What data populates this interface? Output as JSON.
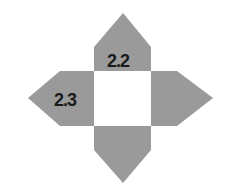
{
  "diagram": {
    "type": "cube-net-star",
    "colors": {
      "arm_fill": "#9a9a9a",
      "center_fill": "#ffffff",
      "label": "#1a1a1a"
    },
    "labels": {
      "top": "2.2",
      "left": "2.3"
    },
    "arms": [
      "top",
      "left",
      "right",
      "bottom"
    ]
  }
}
